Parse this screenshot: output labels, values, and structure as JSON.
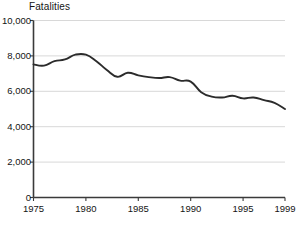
{
  "chart_data": {
    "type": "line",
    "title": "Fatalities",
    "xlabel": "",
    "ylabel": "",
    "ylim": [
      0,
      10000
    ],
    "xlim": [
      1975,
      1999
    ],
    "grid": true,
    "legend": "none",
    "y_ticks": [
      0,
      2000,
      4000,
      6000,
      8000,
      10000
    ],
    "y_tick_labels": [
      "0",
      "2,000",
      "4,000",
      "6,000",
      "8,000",
      "10,000"
    ],
    "x_ticks": [
      1975,
      1980,
      1985,
      1990,
      1995,
      1999
    ],
    "x_tick_labels": [
      "1975",
      "1980",
      "1985",
      "1990",
      "1995",
      "1999"
    ],
    "line_color": "#2b2b2b",
    "grid_color": "#d8d8d8",
    "axis_color": "#3a3a3a",
    "background_color": "#ffffff",
    "x": [
      1975,
      1976,
      1977,
      1978,
      1979,
      1980,
      1981,
      1982,
      1983,
      1984,
      1985,
      1986,
      1987,
      1988,
      1989,
      1990,
      1991,
      1992,
      1993,
      1994,
      1995,
      1996,
      1997,
      1998,
      1999
    ],
    "series": [
      {
        "name": "Fatalities",
        "values": [
          7520,
          7450,
          7700,
          7800,
          8070,
          8070,
          7700,
          7200,
          6820,
          7050,
          6900,
          6800,
          6750,
          6800,
          6600,
          6550,
          5950,
          5700,
          5650,
          5750,
          5600,
          5650,
          5500,
          5350,
          5000
        ]
      }
    ]
  }
}
